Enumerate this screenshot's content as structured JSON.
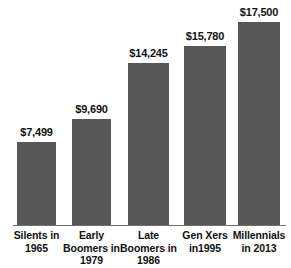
{
  "chart_data": {
    "type": "bar",
    "title": "",
    "subtitle": "",
    "xlabel": "",
    "ylabel": "",
    "ylim": [
      0,
      17500
    ],
    "grid": false,
    "legend": false,
    "legend_position": "none",
    "orientation": "vertical",
    "bar_color": "#575757",
    "axis_color": "#6f6f6f",
    "text_color": "#111111",
    "categories": [
      "Silents in 1965",
      "Early Boomers in 1979",
      "Late Boomers in 1986",
      "Gen Xers in1995",
      "Millennials in 2013"
    ],
    "category_lines": [
      [
        "Silents in",
        "1965"
      ],
      [
        "Early",
        "Boomers in",
        "1979"
      ],
      [
        "Late",
        "Boomers in",
        "1986"
      ],
      [
        "Gen Xers",
        "in1995"
      ],
      [
        "Millennials",
        "in 2013"
      ]
    ],
    "values": [
      7499,
      9690,
      14245,
      15780,
      17500
    ],
    "value_labels": [
      "$7,499",
      "$9,690",
      "$14,245",
      "$15,780",
      "$17,500"
    ],
    "bars": [
      {
        "category": "Silents in 1965",
        "value": 7499,
        "value_label": "$7,499",
        "lines": [
          "Silents in",
          "1965"
        ]
      },
      {
        "category": "Early Boomers in 1979",
        "value": 9690,
        "value_label": "$9,690",
        "lines": [
          "Early",
          "Boomers in",
          "1979"
        ]
      },
      {
        "category": "Late Boomers in 1986",
        "value": 14245,
        "value_label": "$14,245",
        "lines": [
          "Late",
          "Boomers in",
          "1986"
        ]
      },
      {
        "category": "Gen Xers in1995",
        "value": 15780,
        "value_label": "$15,780",
        "lines": [
          "Gen Xers",
          "in1995"
        ]
      },
      {
        "category": "Millennials in 2013",
        "value": 17500,
        "value_label": "$17,500",
        "lines": [
          "Millennials",
          "in 2013"
        ]
      }
    ]
  },
  "layout": {
    "bar_geometry": [
      {
        "left": 17,
        "width": 39,
        "top": 141
      },
      {
        "left": 72,
        "width": 39,
        "top": 118
      },
      {
        "left": 128,
        "width": 41,
        "top": 62
      },
      {
        "left": 184,
        "width": 42,
        "top": 45
      },
      {
        "left": 238,
        "width": 42,
        "top": 21
      }
    ],
    "label_geometry": [
      {
        "left": 3,
        "width": 67
      },
      {
        "left": 58,
        "width": 67
      },
      {
        "left": 115,
        "width": 67
      },
      {
        "left": 170,
        "width": 70
      },
      {
        "left": 224,
        "width": 70
      }
    ],
    "baseline_y": 225
  }
}
